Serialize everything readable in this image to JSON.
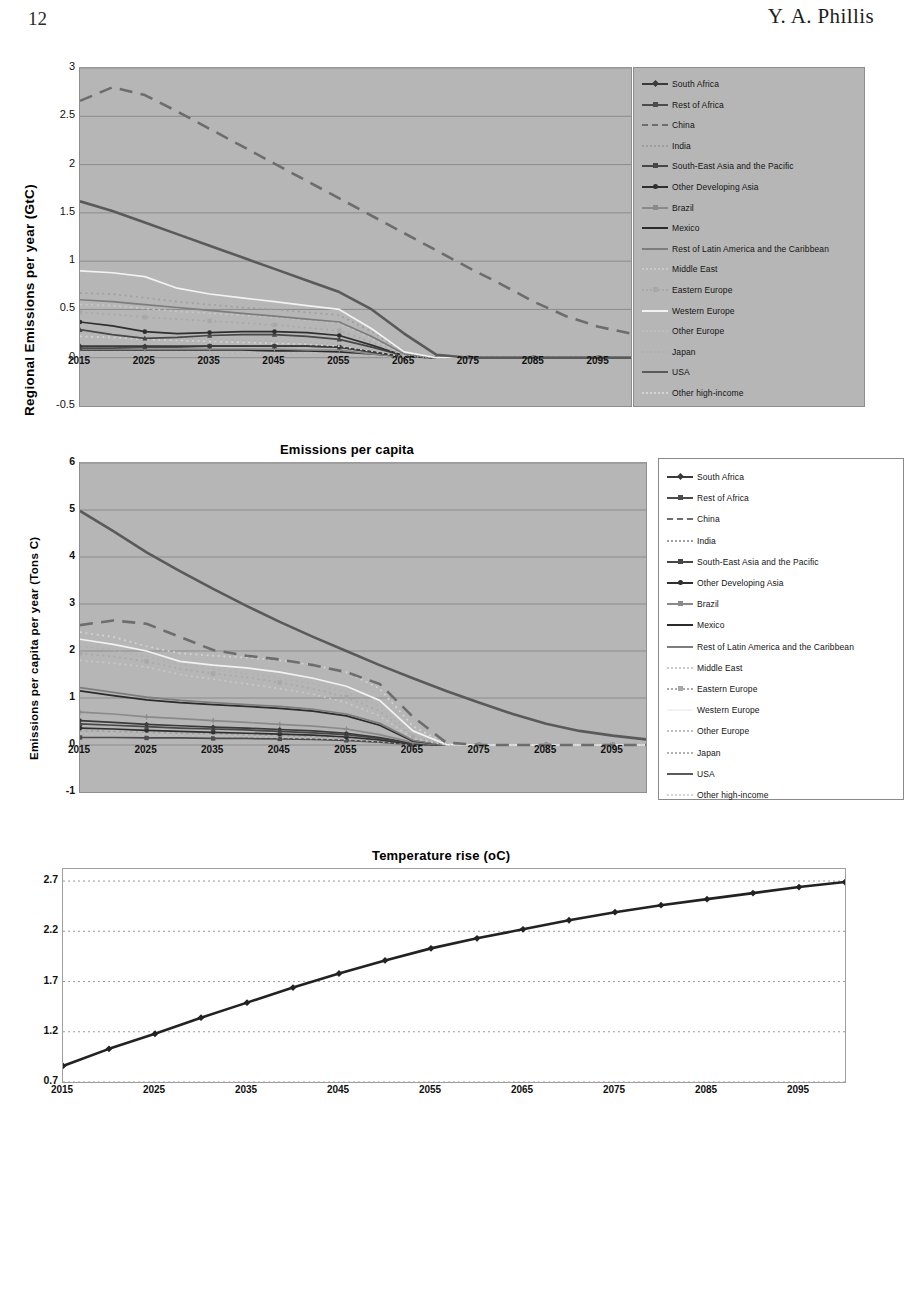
{
  "page": {
    "number": "12",
    "author": "Y. A. Phillis"
  },
  "figures": [
    {
      "id": "regional-emissions",
      "title": "",
      "ylabel": "Regional  Emissions per year  (GtC)",
      "xlabel": "",
      "yticks": [
        "3",
        "2.5",
        "2",
        "1.5",
        "1",
        "0.5",
        "0",
        "-0.5"
      ],
      "xticks": [
        "2015",
        "2025",
        "2035",
        "2045",
        "2055",
        "2065",
        "2075",
        "2085",
        "2095"
      ]
    },
    {
      "id": "emissions-per-capita",
      "title": "Emissions per capita",
      "ylabel": "Emissions per capita  per year  (Tons C)",
      "xlabel": "",
      "yticks": [
        "6",
        "5",
        "4",
        "3",
        "2",
        "1",
        "0",
        "-1"
      ],
      "xticks": [
        "2015",
        "2025",
        "2035",
        "2045",
        "2055",
        "2065",
        "2075",
        "2085",
        "2095"
      ]
    },
    {
      "id": "temperature-rise",
      "title": "Temperature rise (oC)",
      "ylabel": "",
      "xlabel": "",
      "yticks": [
        "2.7",
        "2.2",
        "1.7",
        "1.2",
        "0.7"
      ],
      "xticks": [
        "2015",
        "2025",
        "2035",
        "2045",
        "2055",
        "2065",
        "2075",
        "2085",
        "2095"
      ]
    }
  ],
  "legend_entries": [
    {
      "label": "South Africa",
      "color": "#3a3a3a",
      "style": "solid",
      "marker": "diamond"
    },
    {
      "label": "Rest of Africa",
      "color": "#4c4c4c",
      "style": "solid",
      "marker": "square"
    },
    {
      "label": "China",
      "color": "#6d6d6d",
      "style": "dashed",
      "marker": "none"
    },
    {
      "label": "India",
      "color": "#9e9e9e",
      "style": "dotted",
      "marker": "none"
    },
    {
      "label": "South-East Asia and the Pacific",
      "color": "#474747",
      "style": "solid",
      "marker": "triangle"
    },
    {
      "label": "Other Developing Asia",
      "color": "#2f2f2f",
      "style": "solid",
      "marker": "circle"
    },
    {
      "label": "Brazil",
      "color": "#8a8a8a",
      "style": "solid",
      "marker": "plus"
    },
    {
      "label": "Mexico",
      "color": "#2b2b2b",
      "style": "solid",
      "marker": "none"
    },
    {
      "label": "Rest of Latin America and the Caribbean",
      "color": "#7d7d7d",
      "style": "solid",
      "marker": "none"
    },
    {
      "label": "Middle East",
      "color": "#c9c9c9",
      "style": "dotted",
      "marker": "none"
    },
    {
      "label": "Eastern Europe",
      "color": "#a8a8a8",
      "style": "dotted",
      "marker": "square"
    },
    {
      "label": "Western Europe",
      "color": "#f2f2f2",
      "style": "solid",
      "marker": "none"
    },
    {
      "label": "Other Europe",
      "color": "#bdbdbd",
      "style": "dotted",
      "marker": "none"
    },
    {
      "label": "Japan",
      "color": "#b0b0b0",
      "style": "dotted",
      "marker": "none"
    },
    {
      "label": "USA",
      "color": "#5a5a5a",
      "style": "solid",
      "marker": "none"
    },
    {
      "label": "Other high-income",
      "color": "#d4d4d4",
      "style": "dotted",
      "marker": "none"
    }
  ],
  "chart_data": [
    {
      "type": "line",
      "id": "regional-emissions",
      "title": "",
      "xlabel": "",
      "ylabel": "Regional  Emissions per year  (GtC)",
      "xlim": [
        2015,
        2100
      ],
      "ylim": [
        -0.5,
        3
      ],
      "xticks": [
        2015,
        2025,
        2035,
        2045,
        2055,
        2065,
        2075,
        2085,
        2095
      ],
      "yticks": [
        -0.5,
        0,
        0.5,
        1,
        1.5,
        2,
        2.5,
        3
      ],
      "grid": true,
      "legend_position": "right",
      "x": [
        2015,
        2020,
        2025,
        2030,
        2035,
        2040,
        2045,
        2050,
        2055,
        2060,
        2065,
        2070,
        2075,
        2080,
        2085,
        2090,
        2095,
        2100
      ],
      "series": [
        {
          "name": "China",
          "values": [
            2.66,
            2.8,
            2.72,
            2.55,
            2.37,
            2.19,
            2.01,
            1.83,
            1.65,
            1.47,
            1.29,
            1.11,
            0.93,
            0.76,
            0.58,
            0.43,
            0.32,
            0.25
          ]
        },
        {
          "name": "USA",
          "values": [
            1.62,
            1.52,
            1.4,
            1.28,
            1.16,
            1.04,
            0.92,
            0.8,
            0.68,
            0.5,
            0.25,
            0.03,
            0.0,
            0.0,
            0.0,
            0.0,
            0.0,
            0.0
          ]
        },
        {
          "name": "Western Europe",
          "values": [
            0.9,
            0.88,
            0.84,
            0.72,
            0.66,
            0.62,
            0.58,
            0.54,
            0.5,
            0.3,
            0.06,
            0.0,
            0.0,
            0.0,
            0.0,
            0.0,
            0.0,
            0.0
          ]
        },
        {
          "name": "India",
          "values": [
            0.67,
            0.66,
            0.62,
            0.58,
            0.55,
            0.52,
            0.5,
            0.47,
            0.44,
            0.27,
            0.05,
            0.0,
            0.0,
            0.0,
            0.0,
            0.0,
            0.0,
            0.0
          ]
        },
        {
          "name": "Rest of Latin America and the Caribbean",
          "values": [
            0.6,
            0.58,
            0.55,
            0.52,
            0.49,
            0.46,
            0.43,
            0.4,
            0.37,
            0.22,
            0.04,
            0.0,
            0.0,
            0.0,
            0.0,
            0.0,
            0.0,
            0.0
          ]
        },
        {
          "name": "Middle East",
          "values": [
            0.55,
            0.54,
            0.51,
            0.48,
            0.46,
            0.44,
            0.42,
            0.39,
            0.36,
            0.2,
            0.03,
            0.0,
            0.0,
            0.0,
            0.0,
            0.0,
            0.0,
            0.0
          ]
        },
        {
          "name": "Eastern Europe",
          "values": [
            0.47,
            0.45,
            0.42,
            0.4,
            0.38,
            0.36,
            0.34,
            0.31,
            0.28,
            0.16,
            0.02,
            0.0,
            0.0,
            0.0,
            0.0,
            0.0,
            0.0,
            0.0
          ]
        },
        {
          "name": "Other Developing Asia",
          "values": [
            0.37,
            0.33,
            0.27,
            0.25,
            0.26,
            0.27,
            0.27,
            0.26,
            0.23,
            0.13,
            0.02,
            0.0,
            0.0,
            0.0,
            0.0,
            0.0,
            0.0,
            0.0
          ]
        },
        {
          "name": "South-East Asia and the Pacific",
          "values": [
            0.29,
            0.24,
            0.2,
            0.21,
            0.23,
            0.24,
            0.24,
            0.22,
            0.19,
            0.11,
            0.02,
            0.0,
            0.0,
            0.0,
            0.0,
            0.0,
            0.0,
            0.0
          ]
        },
        {
          "name": "Japan",
          "values": [
            0.26,
            0.24,
            0.22,
            0.2,
            0.19,
            0.18,
            0.17,
            0.16,
            0.14,
            0.08,
            0.01,
            0.0,
            0.0,
            0.0,
            0.0,
            0.0,
            0.0,
            0.0
          ]
        },
        {
          "name": "Other high-income",
          "values": [
            0.22,
            0.21,
            0.19,
            0.18,
            0.17,
            0.16,
            0.15,
            0.14,
            0.12,
            0.07,
            0.01,
            0.0,
            0.0,
            0.0,
            0.0,
            0.0,
            0.0,
            0.0
          ]
        },
        {
          "name": "South Africa",
          "values": [
            0.12,
            0.12,
            0.12,
            0.12,
            0.12,
            0.12,
            0.12,
            0.12,
            0.11,
            0.06,
            0.01,
            0.0,
            0.0,
            0.0,
            0.0,
            0.0,
            0.0,
            0.0
          ]
        },
        {
          "name": "Rest of Africa",
          "values": [
            0.1,
            0.1,
            0.11,
            0.11,
            0.12,
            0.12,
            0.12,
            0.12,
            0.11,
            0.06,
            0.01,
            0.0,
            0.0,
            0.0,
            0.0,
            0.0,
            0.0,
            0.0
          ]
        },
        {
          "name": "Brazil",
          "values": [
            0.09,
            0.09,
            0.09,
            0.09,
            0.09,
            0.09,
            0.09,
            0.08,
            0.08,
            0.04,
            0.01,
            0.0,
            0.0,
            0.0,
            0.0,
            0.0,
            0.0,
            0.0
          ]
        },
        {
          "name": "Mexico",
          "values": [
            0.08,
            0.08,
            0.08,
            0.08,
            0.08,
            0.08,
            0.07,
            0.07,
            0.06,
            0.04,
            0.01,
            0.0,
            0.0,
            0.0,
            0.0,
            0.0,
            0.0,
            0.0
          ]
        },
        {
          "name": "Other Europe",
          "values": [
            0.06,
            0.06,
            0.06,
            0.06,
            0.06,
            0.05,
            0.05,
            0.05,
            0.04,
            0.02,
            0.0,
            0.0,
            0.0,
            0.0,
            0.0,
            0.0,
            0.0,
            0.0
          ]
        }
      ]
    },
    {
      "type": "line",
      "id": "emissions-per-capita",
      "title": "Emissions per capita",
      "xlabel": "",
      "ylabel": "Emissions per capita  per year  (Tons C)",
      "xlim": [
        2015,
        2100
      ],
      "ylim": [
        -1,
        6
      ],
      "xticks": [
        2015,
        2025,
        2035,
        2045,
        2055,
        2065,
        2075,
        2085,
        2095
      ],
      "yticks": [
        -1,
        0,
        1,
        2,
        3,
        4,
        5,
        6
      ],
      "grid": true,
      "legend_position": "right",
      "x": [
        2015,
        2020,
        2025,
        2030,
        2035,
        2040,
        2045,
        2050,
        2055,
        2060,
        2065,
        2070,
        2075,
        2080,
        2085,
        2090,
        2095,
        2100
      ],
      "series": [
        {
          "name": "USA",
          "values": [
            4.98,
            4.55,
            4.1,
            3.7,
            3.32,
            2.96,
            2.62,
            2.3,
            2.0,
            1.7,
            1.42,
            1.15,
            0.9,
            0.66,
            0.45,
            0.3,
            0.2,
            0.12
          ]
        },
        {
          "name": "China",
          "values": [
            2.55,
            2.65,
            2.58,
            2.3,
            2.02,
            1.9,
            1.82,
            1.7,
            1.55,
            1.3,
            0.6,
            0.05,
            0.0,
            0.0,
            0.0,
            0.0,
            0.0,
            0.0
          ]
        },
        {
          "name": "Other high-income",
          "values": [
            2.4,
            2.3,
            2.1,
            1.95,
            1.9,
            1.86,
            1.8,
            1.7,
            1.55,
            1.2,
            0.4,
            0.02,
            0.0,
            0.0,
            0.0,
            0.0,
            0.0,
            0.0
          ]
        },
        {
          "name": "Western Europe",
          "values": [
            2.25,
            2.14,
            2.0,
            1.78,
            1.7,
            1.64,
            1.55,
            1.42,
            1.25,
            0.95,
            0.3,
            0.01,
            0.0,
            0.0,
            0.0,
            0.0,
            0.0,
            0.0
          ]
        },
        {
          "name": "Japan",
          "values": [
            2.1,
            2.02,
            1.88,
            1.72,
            1.62,
            1.52,
            1.42,
            1.3,
            1.12,
            0.82,
            0.22,
            0.0,
            0.0,
            0.0,
            0.0,
            0.0,
            0.0,
            0.0
          ]
        },
        {
          "name": "Eastern Europe",
          "values": [
            1.95,
            1.88,
            1.78,
            1.62,
            1.52,
            1.44,
            1.33,
            1.2,
            1.02,
            0.72,
            0.18,
            0.0,
            0.0,
            0.0,
            0.0,
            0.0,
            0.0,
            0.0
          ]
        },
        {
          "name": "Middle East",
          "values": [
            1.8,
            1.74,
            1.66,
            1.5,
            1.4,
            1.3,
            1.2,
            1.08,
            0.9,
            0.62,
            0.14,
            0.0,
            0.0,
            0.0,
            0.0,
            0.0,
            0.0,
            0.0
          ]
        },
        {
          "name": "Rest of Latin America and the Caribbean",
          "values": [
            1.22,
            1.12,
            1.02,
            0.95,
            0.9,
            0.86,
            0.82,
            0.76,
            0.66,
            0.46,
            0.1,
            0.0,
            0.0,
            0.0,
            0.0,
            0.0,
            0.0,
            0.0
          ]
        },
        {
          "name": "Mexico",
          "values": [
            1.15,
            1.05,
            0.96,
            0.9,
            0.86,
            0.82,
            0.78,
            0.72,
            0.62,
            0.42,
            0.08,
            0.0,
            0.0,
            0.0,
            0.0,
            0.0,
            0.0,
            0.0
          ]
        },
        {
          "name": "Brazil",
          "values": [
            0.7,
            0.66,
            0.6,
            0.56,
            0.52,
            0.48,
            0.44,
            0.4,
            0.34,
            0.22,
            0.05,
            0.0,
            0.0,
            0.0,
            0.0,
            0.0,
            0.0,
            0.0
          ]
        },
        {
          "name": "South Africa",
          "values": [
            0.52,
            0.48,
            0.44,
            0.41,
            0.38,
            0.36,
            0.33,
            0.3,
            0.25,
            0.16,
            0.03,
            0.0,
            0.0,
            0.0,
            0.0,
            0.0,
            0.0,
            0.0
          ]
        },
        {
          "name": "South-East Asia and the Pacific",
          "values": [
            0.45,
            0.42,
            0.39,
            0.36,
            0.34,
            0.32,
            0.29,
            0.26,
            0.22,
            0.14,
            0.03,
            0.0,
            0.0,
            0.0,
            0.0,
            0.0,
            0.0,
            0.0
          ]
        },
        {
          "name": "Other Developing Asia",
          "values": [
            0.36,
            0.34,
            0.31,
            0.29,
            0.27,
            0.25,
            0.23,
            0.21,
            0.17,
            0.11,
            0.02,
            0.0,
            0.0,
            0.0,
            0.0,
            0.0,
            0.0,
            0.0
          ]
        },
        {
          "name": "India",
          "values": [
            0.3,
            0.29,
            0.27,
            0.25,
            0.24,
            0.22,
            0.2,
            0.18,
            0.15,
            0.09,
            0.02,
            0.0,
            0.0,
            0.0,
            0.0,
            0.0,
            0.0,
            0.0
          ]
        },
        {
          "name": "Other Europe",
          "values": [
            0.24,
            0.23,
            0.22,
            0.2,
            0.19,
            0.18,
            0.16,
            0.14,
            0.12,
            0.07,
            0.01,
            0.0,
            0.0,
            0.0,
            0.0,
            0.0,
            0.0,
            0.0
          ]
        },
        {
          "name": "Rest of Africa",
          "values": [
            0.16,
            0.16,
            0.15,
            0.15,
            0.14,
            0.14,
            0.13,
            0.12,
            0.1,
            0.06,
            0.01,
            0.0,
            0.0,
            0.0,
            0.0,
            0.0,
            0.0,
            0.0
          ]
        }
      ]
    },
    {
      "type": "line",
      "id": "temperature-rise",
      "title": "Temperature rise (oC)",
      "xlabel": "",
      "ylabel": "",
      "xlim": [
        2015,
        2100
      ],
      "ylim": [
        0.7,
        2.82
      ],
      "xticks": [
        2015,
        2025,
        2035,
        2045,
        2055,
        2065,
        2075,
        2085,
        2095
      ],
      "yticks": [
        0.7,
        1.2,
        1.7,
        2.2,
        2.7
      ],
      "grid": true,
      "legend_position": "none",
      "x": [
        2015,
        2020,
        2025,
        2030,
        2035,
        2040,
        2045,
        2050,
        2055,
        2060,
        2065,
        2070,
        2075,
        2080,
        2085,
        2090,
        2095,
        2100
      ],
      "series": [
        {
          "name": "Temperature rise",
          "values": [
            0.86,
            1.03,
            1.18,
            1.34,
            1.49,
            1.64,
            1.78,
            1.91,
            2.03,
            2.13,
            2.22,
            2.31,
            2.39,
            2.46,
            2.52,
            2.58,
            2.64,
            2.69
          ]
        }
      ]
    }
  ]
}
